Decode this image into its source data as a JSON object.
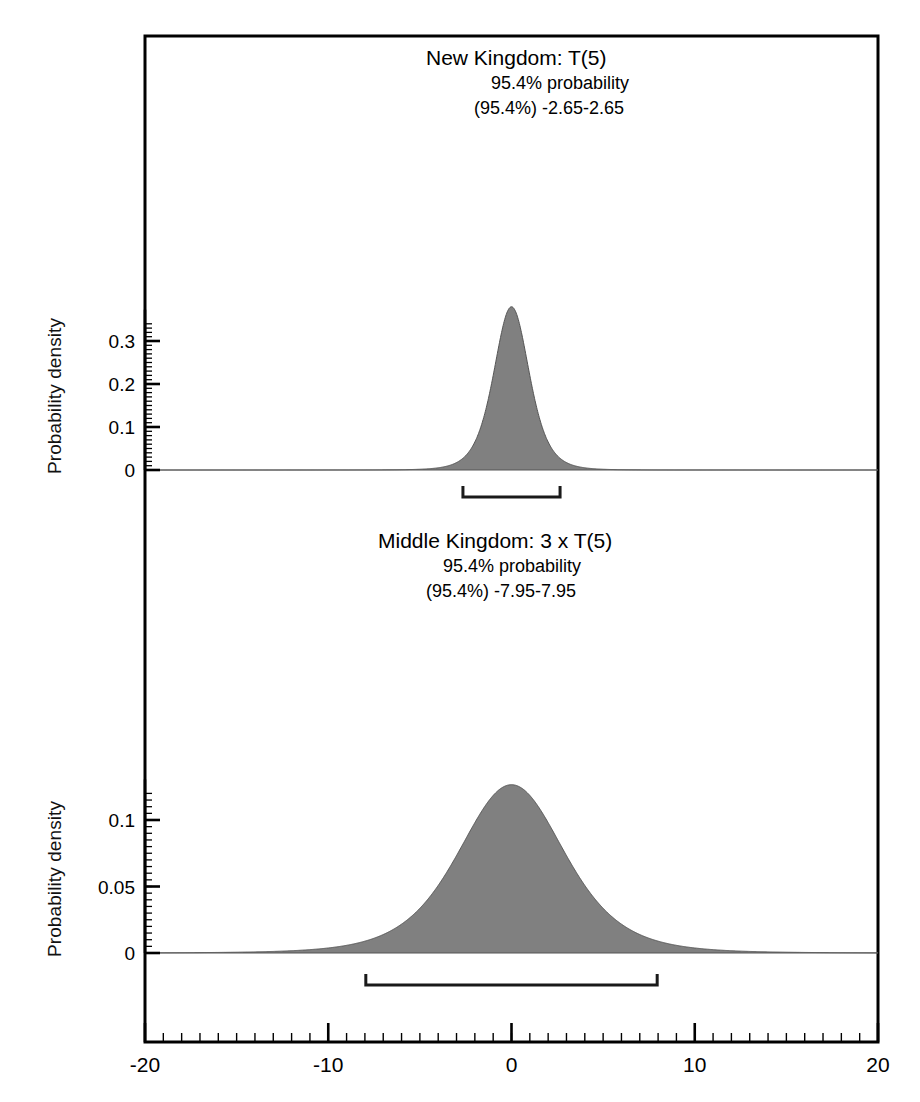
{
  "chart_data": {
    "type": "area",
    "title": "",
    "xlabel": "",
    "ylabel": "Probability density",
    "xlim": [
      -20,
      20
    ],
    "grid": false,
    "legend": "none",
    "x_ticks_major": [
      -20,
      -10,
      0,
      10,
      20
    ],
    "x_tick_labels": [
      "-20",
      "-10",
      "0",
      "10",
      "20"
    ],
    "x_tick_minor_step": 1,
    "fill_color": "#808080",
    "outline_color": "#555555",
    "axis_color": "#000000",
    "panels": [
      {
        "name": "New Kingdom",
        "title_main": "New Kingdom: T(5)",
        "title_line2": "95.4% probability",
        "title_line3": "(95.4%) -2.65-2.65",
        "distribution": "t",
        "df": 5,
        "scale": 1,
        "center": 0,
        "peak_density": 0.3796,
        "ylabel": "Probability density",
        "ylim": [
          0,
          0.345
        ],
        "y_ticks_major": [
          0,
          0.1,
          0.2,
          0.3
        ],
        "y_tick_labels": [
          "0",
          "0.1",
          "0.2",
          "0.3"
        ],
        "y_tick_minor_step": 0.01,
        "interval_probability": "95.4%",
        "interval_start": -2.65,
        "interval_end": 2.65
      },
      {
        "name": "Middle Kingdom",
        "title_main": "Middle Kingdom: 3 x T(5)",
        "title_line2": "95.4% probability",
        "title_line3": "(95.4%) -7.95-7.95",
        "distribution": "t",
        "df": 5,
        "scale": 3,
        "center": 0,
        "peak_density": 0.1265,
        "ylabel": "Probability density",
        "ylim": [
          0,
          0.1215
        ],
        "y_ticks_major": [
          0,
          0.05,
          0.1
        ],
        "y_tick_labels": [
          "0",
          "0.05",
          "0.1"
        ],
        "y_tick_minor_step": 0.005,
        "interval_probability": "95.4%",
        "interval_start": -7.95,
        "interval_end": 7.95
      }
    ]
  }
}
